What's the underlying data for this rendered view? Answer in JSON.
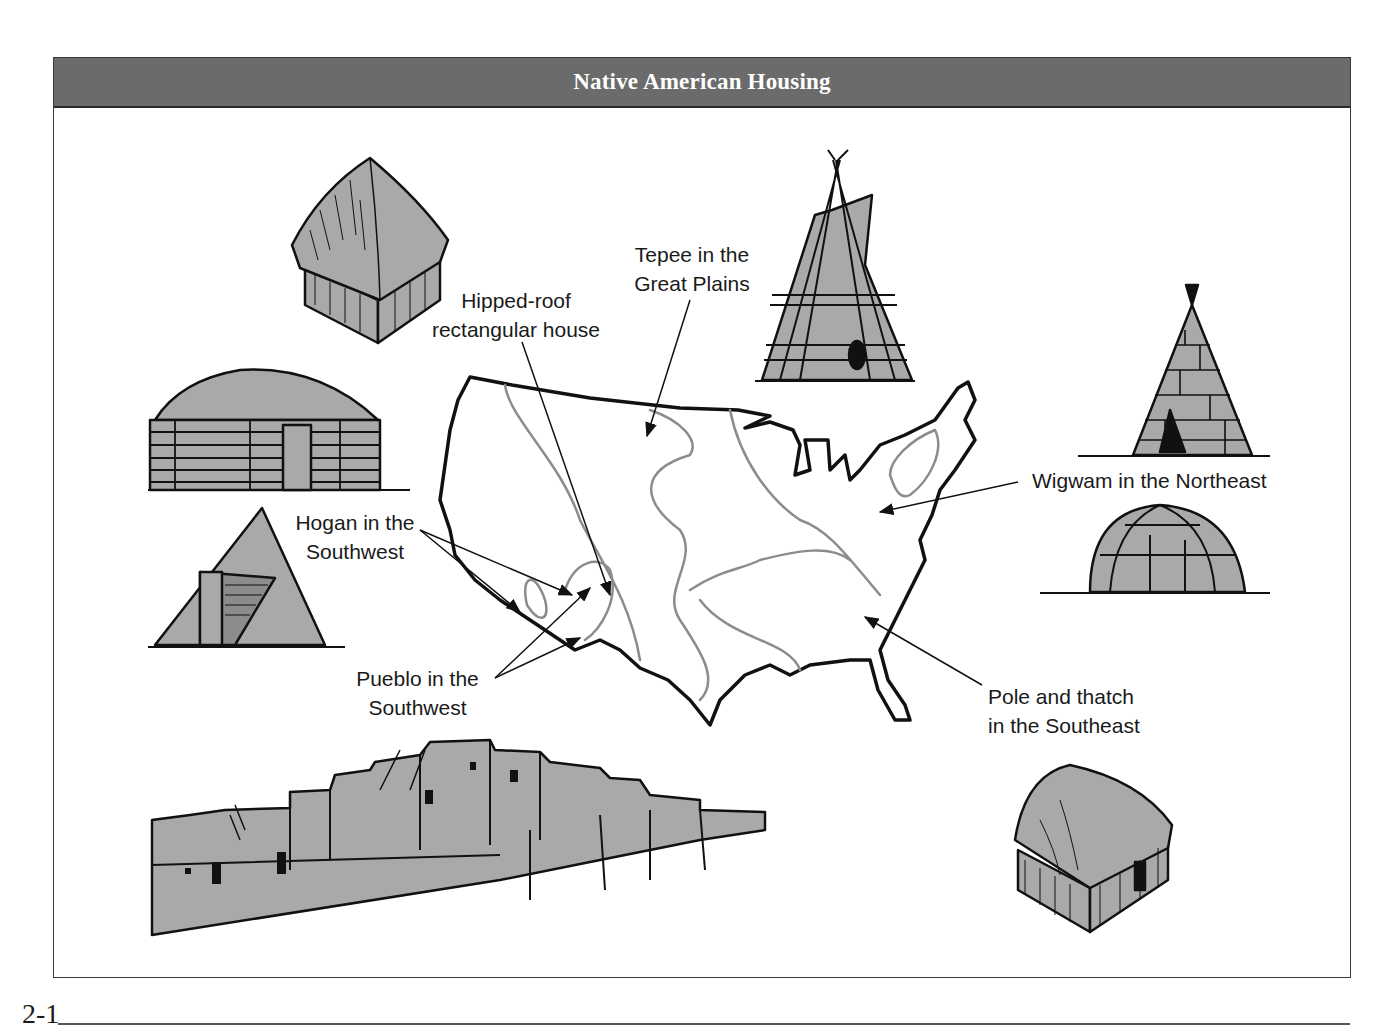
{
  "header": {
    "title": "Native American Housing",
    "background_color": "#6b6b6b",
    "text_color": "#ffffff"
  },
  "labels": {
    "hipped_roof": {
      "line1": "Hipped-roof",
      "line2": "rectangular house"
    },
    "tepee": {
      "line1": "Tepee in the",
      "line2": "Great Plains"
    },
    "hogan": {
      "line1": "Hogan in the",
      "line2": "Southwest"
    },
    "pueblo": {
      "line1": "Pueblo in the",
      "line2": "Southwest"
    },
    "wigwam": {
      "line1": "Wigwam in the Northeast"
    },
    "pole_thatch": {
      "line1": "Pole and thatch",
      "line2": "in the Southeast"
    }
  },
  "illustrations": [
    {
      "id": "hipped-roof-house",
      "description": "thatched hipped-roof rectangular house"
    },
    {
      "id": "earth-lodge-log-hogan",
      "description": "log hogan with domed earthen roof"
    },
    {
      "id": "pyramid-hogan",
      "description": "forked-stick conical hogan with entry"
    },
    {
      "id": "tepee",
      "description": "plains tepee with poles"
    },
    {
      "id": "conical-wigwam",
      "description": "bark-covered conical wigwam"
    },
    {
      "id": "domed-wigwam",
      "description": "bark-covered domed wigwam"
    },
    {
      "id": "pueblo",
      "description": "multi-story adobe pueblo with ladders"
    },
    {
      "id": "pole-thatch-house",
      "description": "thatched pole house"
    }
  ],
  "map": {
    "subject": "outline of contiguous United States with culture-region boundaries"
  },
  "colors": {
    "fill_gray": "#a9a9a9",
    "outline": "#111111",
    "region_line": "#8c8c8c"
  },
  "footer": {
    "page_number": "2-1"
  }
}
